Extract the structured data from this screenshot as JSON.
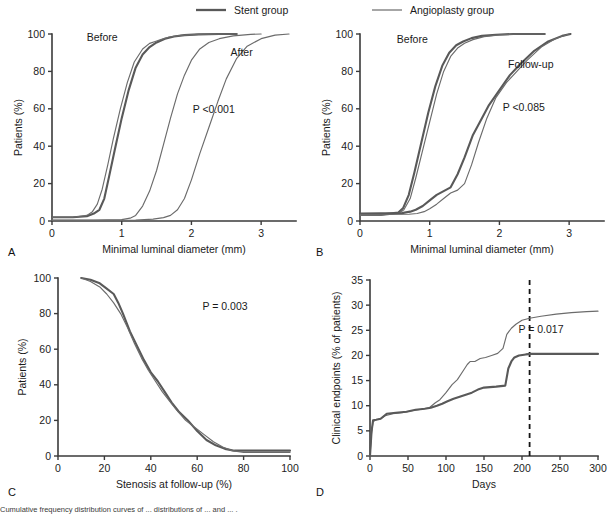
{
  "figure": {
    "legend": {
      "items": [
        {
          "label": "Stent group",
          "style": "thick-line",
          "color": "#595959"
        },
        {
          "label": "Angioplasty group",
          "style": "thin-line",
          "color": "#6b6b6b"
        }
      ]
    },
    "caption_text": "Cumulative frequency distribution curves of ... distributions of ... and ... ."
  },
  "chart_data": [
    {
      "id": "panel-a",
      "panel_letter": "A",
      "type": "line",
      "title": "",
      "xlabel": "Minimal luminal diameter (mm)",
      "ylabel": "Patients (%)",
      "xlim": [
        0,
        3.5
      ],
      "ylim": [
        0,
        100
      ],
      "xticks": [
        0,
        1,
        2,
        3
      ],
      "yticks": [
        0,
        20,
        40,
        60,
        80,
        100
      ],
      "grid": false,
      "legend_position": "none",
      "annotations": [
        {
          "text": "Before",
          "x": 0.72,
          "y": 96
        },
        {
          "text": "After",
          "x": 2.72,
          "y": 88
        },
        {
          "text": "P <0.001",
          "x": 2.32,
          "y": 58
        }
      ],
      "series": [
        {
          "name": "Stent group before",
          "style": "thick-line",
          "x": [
            0,
            0.3,
            0.5,
            0.6,
            0.68,
            0.75,
            0.82,
            0.9,
            1.0,
            1.1,
            1.2,
            1.3,
            1.4,
            1.5,
            1.62,
            1.75,
            1.9,
            2.1,
            2.4,
            2.65
          ],
          "y": [
            2,
            2,
            2.5,
            4,
            6,
            12,
            24,
            38,
            55,
            70,
            82,
            89,
            93,
            95.5,
            97.5,
            98.7,
            99.4,
            99.8,
            100,
            100
          ]
        },
        {
          "name": "Angioplasty group before",
          "style": "thin-line",
          "x": [
            0,
            0.3,
            0.5,
            0.58,
            0.65,
            0.72,
            0.8,
            0.88,
            0.98,
            1.08,
            1.18,
            1.3,
            1.4,
            1.48,
            1.56,
            1.68,
            1.85,
            2.1,
            2.4,
            2.65
          ],
          "y": [
            2,
            2,
            3,
            5,
            9,
            17,
            30,
            44,
            60,
            74,
            85,
            92,
            95,
            96,
            97,
            98.4,
            99.3,
            99.8,
            100,
            100
          ]
        },
        {
          "name": "Angioplasty group after",
          "style": "thin-line",
          "x": [
            0,
            0.6,
            1.0,
            1.12,
            1.2,
            1.3,
            1.4,
            1.5,
            1.6,
            1.7,
            1.8,
            1.9,
            2.0,
            2.12,
            2.25,
            2.4,
            2.6,
            2.85,
            3.0
          ],
          "y": [
            0.5,
            0.5,
            0.7,
            1.5,
            3,
            8,
            16,
            27,
            41,
            55,
            68,
            78,
            86,
            92,
            95.5,
            97.5,
            99,
            99.8,
            100
          ]
        },
        {
          "name": "Stent group after",
          "style": "thin-line",
          "x": [
            0,
            0.8,
            1.2,
            1.45,
            1.6,
            1.7,
            1.8,
            1.9,
            2.0,
            2.12,
            2.25,
            2.38,
            2.5,
            2.65,
            2.8,
            3.0,
            3.2,
            3.4
          ],
          "y": [
            0.3,
            0.3,
            0.5,
            1,
            1.8,
            3,
            6,
            12,
            22,
            36,
            50,
            64,
            76,
            87,
            93.5,
            97.5,
            99.4,
            100
          ]
        }
      ]
    },
    {
      "id": "panel-b",
      "panel_letter": "B",
      "type": "line",
      "title": "",
      "xlabel": "Minimal luminal diameter (mm)",
      "ylabel": "Patients (%)",
      "xlim": [
        0,
        3.5
      ],
      "ylim": [
        0,
        100
      ],
      "xticks": [
        0,
        1,
        2,
        3
      ],
      "yticks": [
        0,
        20,
        40,
        60,
        80,
        100
      ],
      "grid": false,
      "legend_position": "none",
      "annotations": [
        {
          "text": "Before",
          "x": 0.75,
          "y": 95
        },
        {
          "text": "Follow-up",
          "x": 2.45,
          "y": 82
        },
        {
          "text": "P <0.085",
          "x": 2.35,
          "y": 59
        }
      ],
      "series": [
        {
          "name": "Stent group before",
          "style": "thick-line",
          "x": [
            0,
            0.3,
            0.55,
            0.62,
            0.7,
            0.78,
            0.88,
            0.98,
            1.08,
            1.18,
            1.28,
            1.38,
            1.48,
            1.6,
            1.75,
            1.95,
            2.2,
            2.5,
            2.65
          ],
          "y": [
            3.5,
            3.5,
            4.5,
            7,
            14,
            26,
            42,
            58,
            72,
            83,
            90,
            94,
            96,
            97.8,
            99,
            99.6,
            100,
            100,
            100
          ]
        },
        {
          "name": "Angioplasty group before",
          "style": "thin-line",
          "x": [
            0,
            0.3,
            0.55,
            0.63,
            0.72,
            0.8,
            0.9,
            1.0,
            1.1,
            1.2,
            1.3,
            1.4,
            1.5,
            1.62,
            1.78,
            2.0,
            2.25,
            2.5,
            2.65
          ],
          "y": [
            3,
            3,
            4,
            6,
            12,
            23,
            38,
            53,
            68,
            80,
            88,
            92.5,
            95,
            97,
            98.6,
            99.5,
            100,
            100,
            100
          ]
        },
        {
          "name": "Stent group follow-up",
          "style": "thick-line",
          "x": [
            0,
            0.6,
            0.72,
            0.8,
            0.9,
            1.0,
            1.1,
            1.2,
            1.3,
            1.4,
            1.5,
            1.62,
            1.72,
            1.85,
            2.0,
            2.15,
            2.3,
            2.5,
            2.7,
            2.9,
            3.02
          ],
          "y": [
            4,
            4.2,
            5,
            6,
            8,
            11,
            14,
            16,
            18,
            25,
            34,
            46,
            53,
            62,
            70,
            78,
            84,
            91,
            96,
            99,
            100
          ]
        },
        {
          "name": "Angioplasty group follow-up",
          "style": "thin-line",
          "x": [
            0,
            0.7,
            0.82,
            0.92,
            1.0,
            1.1,
            1.2,
            1.3,
            1.4,
            1.5,
            1.6,
            1.7,
            1.82,
            1.95,
            2.1,
            2.25,
            2.4,
            2.6,
            2.8,
            3.0
          ],
          "y": [
            3.5,
            3.6,
            4,
            5,
            6.5,
            9,
            12,
            15,
            16.5,
            20,
            30,
            42,
            55,
            66,
            74,
            80,
            86,
            93,
            97.5,
            100
          ]
        }
      ]
    },
    {
      "id": "panel-c",
      "panel_letter": "C",
      "type": "line",
      "title": "",
      "xlabel": "Stenosis at follow-up (%)",
      "ylabel": "Patients (%)",
      "xlim": [
        0,
        100
      ],
      "ylim": [
        0,
        100
      ],
      "xticks": [
        0,
        20,
        40,
        60,
        80,
        100
      ],
      "yticks": [
        0,
        20,
        40,
        60,
        80,
        100
      ],
      "grid": false,
      "legend_position": "none",
      "annotations": [
        {
          "text": "P = 0.003",
          "x": 72,
          "y": 82
        }
      ],
      "series": [
        {
          "name": "Stent group",
          "style": "thick-line",
          "x": [
            10,
            14,
            18,
            21,
            24,
            26,
            28,
            31,
            34,
            37,
            40,
            43,
            46,
            49,
            52,
            56,
            60,
            64,
            68,
            72,
            76,
            82,
            90,
            100
          ],
          "y": [
            100,
            99,
            97,
            94,
            91,
            86,
            80,
            70,
            62,
            54,
            47,
            42,
            36,
            30,
            25,
            20,
            14,
            9,
            6,
            4,
            3,
            3,
            3,
            3
          ]
        },
        {
          "name": "Angioplasty group",
          "style": "thin-line",
          "x": [
            10,
            14,
            18,
            21,
            24,
            27,
            30,
            33,
            36,
            39,
            42,
            45,
            48,
            51,
            55,
            59,
            63,
            67,
            71,
            75,
            80,
            88,
            100
          ],
          "y": [
            100,
            98,
            95,
            91,
            86,
            80,
            72,
            63,
            55,
            48,
            42,
            36,
            31,
            26,
            20,
            16,
            12,
            8,
            5,
            3,
            2,
            2,
            2
          ]
        }
      ]
    },
    {
      "id": "panel-d",
      "panel_letter": "D",
      "type": "line",
      "title": "",
      "xlabel": "Days",
      "ylabel": "Clinical endpoints (% of patients)",
      "xlim": [
        0,
        300
      ],
      "ylim": [
        0,
        35
      ],
      "xticks": [
        0,
        50,
        100,
        150,
        200,
        250,
        300
      ],
      "yticks": [
        0,
        5,
        10,
        15,
        20,
        25,
        30,
        35
      ],
      "grid": false,
      "legend_position": "none",
      "annotations": [
        {
          "text": "P = 0.017",
          "x": 225,
          "y": 24.5
        }
      ],
      "reference_line": {
        "type": "vertical-dashed",
        "x": 210
      },
      "series": [
        {
          "name": "Angioplasty group",
          "style": "thin-line",
          "x": [
            0,
            2,
            4,
            8,
            14,
            20,
            30,
            42,
            55,
            68,
            78,
            86,
            92,
            100,
            108,
            115,
            122,
            128,
            132,
            138,
            145,
            152,
            160,
            168,
            175,
            180,
            186,
            192,
            200,
            210,
            225,
            245,
            265,
            285,
            300
          ],
          "y": [
            0,
            4.5,
            6.8,
            7.2,
            7.4,
            8.0,
            8.4,
            8.6,
            9.0,
            9.3,
            9.6,
            10.6,
            11.2,
            12.6,
            14.2,
            15.2,
            16.8,
            18.2,
            18.8,
            18.8,
            19.4,
            19.6,
            20.0,
            20.4,
            21.4,
            24.2,
            25.4,
            26.2,
            27.0,
            27.4,
            27.8,
            28.2,
            28.5,
            28.7,
            28.8
          ]
        },
        {
          "name": "Stent group",
          "style": "thick-line",
          "x": [
            0,
            2,
            4,
            8,
            14,
            22,
            34,
            48,
            60,
            72,
            80,
            88,
            95,
            102,
            110,
            118,
            126,
            134,
            142,
            150,
            158,
            166,
            172,
            178,
            182,
            186,
            190,
            196,
            205,
            212,
            240,
            270,
            300
          ],
          "y": [
            0,
            4.8,
            7.1,
            7.2,
            7.4,
            8.4,
            8.6,
            8.8,
            9.2,
            9.4,
            9.6,
            10.0,
            10.4,
            10.9,
            11.4,
            11.8,
            12.2,
            12.6,
            13.2,
            13.6,
            13.7,
            13.8,
            13.9,
            14.0,
            17.4,
            18.8,
            19.6,
            20.0,
            20.2,
            20.3,
            20.3,
            20.3,
            20.3
          ]
        }
      ]
    }
  ]
}
